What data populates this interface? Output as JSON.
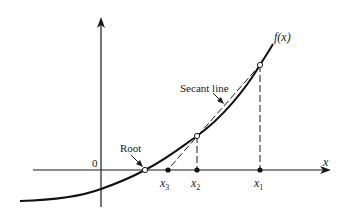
{
  "diagram": {
    "labels": {
      "origin": "0",
      "x_axis": "x",
      "function": "f(x)",
      "secant": "Secant line",
      "root": "Root",
      "x1_base": "x",
      "x1_sub": "1",
      "x2_base": "x",
      "x2_sub": "2",
      "x3_base": "x",
      "x3_sub": "3"
    },
    "colors": {
      "stroke": "#1a1a1a",
      "background": "#ffffff",
      "point_fill_open": "#ffffff",
      "point_fill_solid": "#111111"
    },
    "points": {
      "root": {
        "type": "open"
      },
      "on_curve_x2": {
        "type": "open"
      },
      "on_curve_x1": {
        "type": "open"
      },
      "axis_x3": {
        "type": "solid"
      },
      "axis_x2": {
        "type": "solid"
      },
      "axis_x1": {
        "type": "solid"
      }
    }
  }
}
